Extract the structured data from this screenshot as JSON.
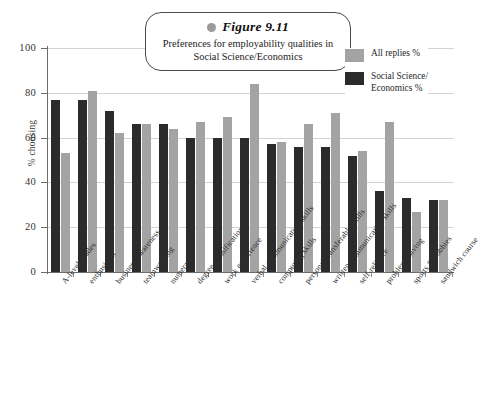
{
  "caption": {
    "dot_icon": "bullet-dot-icon",
    "figure_number": "Figure 9.11",
    "text": "Preferences for employability qualities in Social Science/Economics"
  },
  "legend": {
    "position": "top-right",
    "entries": [
      {
        "label": "All replies %",
        "color": "#a3a3a3",
        "swatch_icon": "legend-swatch-light"
      },
      {
        "label": "Social Science/\nEconomics %",
        "color": "#2b2b2b",
        "swatch_icon": "legend-swatch-dark"
      }
    ]
  },
  "chart_data": {
    "type": "bar",
    "title": "Preferences for employability qualities in Social Science/Economics",
    "xlabel": "",
    "ylabel": "% choosing",
    "ylim": [
      0,
      100
    ],
    "yticks": [
      0,
      20,
      40,
      60,
      80,
      100
    ],
    "grid": true,
    "categories": [
      "A-level grades",
      "enthusiasm",
      "business awareness",
      "teamworking",
      "numeracy",
      "degree classification",
      "work experience",
      "verbal communication skills",
      "computing skills",
      "personal/transferable skills",
      "written communication skills",
      "self-reliance",
      "problem solving",
      "sports & hobbies",
      "sandwich course"
    ],
    "series": [
      {
        "name": "Social Science/Economics %",
        "color": "#2b2b2b",
        "values": [
          77,
          77,
          72,
          66,
          66,
          60,
          60,
          60,
          57,
          56,
          56,
          52,
          36,
          33,
          32
        ]
      },
      {
        "name": "All replies %",
        "color": "#a3a3a3",
        "values": [
          53,
          81,
          62,
          66,
          64,
          67,
          69,
          84,
          58,
          66,
          71,
          54,
          67,
          27,
          32
        ]
      }
    ]
  }
}
